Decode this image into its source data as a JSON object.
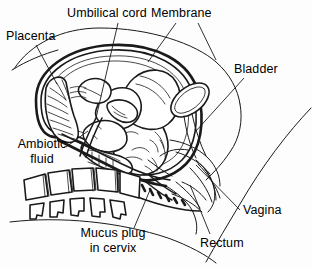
{
  "diagram": {
    "type": "medical-anatomical-illustration",
    "style": "black-and-white line drawing",
    "background_color": "#fdfdfd",
    "line_color": "#1a1a1a",
    "width": 312,
    "height": 267,
    "labels": [
      {
        "id": "umbilical-cord",
        "text": "Umbilical cord",
        "x": 67,
        "y": 8,
        "leader_from": [
          118,
          23
        ],
        "leader_to": [
          96,
          118
        ],
        "align": "left"
      },
      {
        "id": "membrane",
        "text": "Membrane",
        "x": 150,
        "y": 8,
        "leader_from": [
          176,
          23
        ],
        "leader_to": [
          148,
          62
        ],
        "align": "left"
      },
      {
        "id": "placenta",
        "text": "Placenta",
        "x": 8,
        "y": 30,
        "leader_from": [
          36,
          45
        ],
        "leader_to": [
          57,
          84
        ],
        "align": "left"
      },
      {
        "id": "bladder",
        "text": "Bladder",
        "x": 234,
        "y": 63,
        "leader_from": [
          244,
          78
        ],
        "leader_to": [
          196,
          131
        ],
        "align": "left"
      },
      {
        "id": "ambiotic-fluid",
        "text": "Ambiotic fluid",
        "line1": "Ambiotic",
        "line2": "fluid",
        "x": 12,
        "y": 139,
        "leader_from": [
          66,
          147
        ],
        "leader_to": [
          88,
          131
        ],
        "align": "center"
      },
      {
        "id": "vagina",
        "text": "Vagina",
        "x": 242,
        "y": 203,
        "leader_from": [
          240,
          210
        ],
        "leader_to": [
          196,
          165
        ],
        "align": "left"
      },
      {
        "id": "mucus-plug-in-cervix",
        "text": "Mucus plug in cervix",
        "line1": "Mucus plug",
        "line2": "in cervix",
        "x": 74,
        "y": 228,
        "leader_from": [
          134,
          228
        ],
        "leader_to": [
          150,
          190
        ],
        "align": "center"
      },
      {
        "id": "rectum",
        "text": "Rectum",
        "x": 200,
        "y": 235,
        "leader_from": [
          210,
          234
        ],
        "leader_to": [
          190,
          185
        ],
        "align": "left"
      }
    ],
    "structures": [
      {
        "id": "abdominal-wall",
        "name": "Maternal abdominal wall"
      },
      {
        "id": "uterine-wall",
        "name": "Uterine wall"
      },
      {
        "id": "amniotic-membrane",
        "name": "Amniotic membrane"
      },
      {
        "id": "placenta-body",
        "name": "Placenta"
      },
      {
        "id": "fetus",
        "name": "Fetus in vertex presentation"
      },
      {
        "id": "umbilical-cord-body",
        "name": "Umbilical cord"
      },
      {
        "id": "bladder-body",
        "name": "Urinary bladder"
      },
      {
        "id": "sacrum-vertebrae",
        "name": "Sacral vertebrae"
      },
      {
        "id": "spinous-processes",
        "name": "Spinous processes"
      },
      {
        "id": "cervix-body",
        "name": "Cervix with mucus plug"
      },
      {
        "id": "vagina-body",
        "name": "Vagina"
      },
      {
        "id": "rectum-body",
        "name": "Rectum"
      }
    ]
  }
}
